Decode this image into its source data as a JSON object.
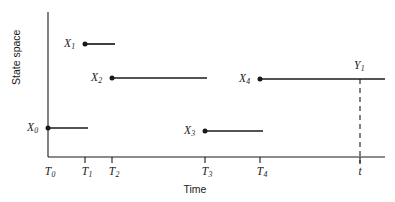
{
  "figure": {
    "type": "step-process-diagram",
    "background_color": "#ffffff",
    "line_color": "#1a1a1a",
    "width": 395,
    "height": 202
  },
  "axes": {
    "y": {
      "title": "State space",
      "x_px": 48,
      "top_px": 12,
      "bottom_px": 157
    },
    "x": {
      "title": "Time",
      "y_px": 157,
      "left_px": 48,
      "right_px": 385
    }
  },
  "ticks": [
    {
      "name": "T0",
      "base": "T",
      "sub": "0",
      "x_px": 48
    },
    {
      "name": "T1",
      "base": "T",
      "sub": "1",
      "x_px": 85
    },
    {
      "name": "T2",
      "base": "T",
      "sub": "2",
      "x_px": 112
    },
    {
      "name": "T3",
      "base": "T",
      "sub": "3",
      "x_px": 205
    },
    {
      "name": "T4",
      "base": "T",
      "sub": "4",
      "x_px": 260
    },
    {
      "name": "t",
      "base": "t",
      "sub": "",
      "x_px": 360
    }
  ],
  "segments": [
    {
      "name": "X0",
      "base": "X",
      "sub": "0",
      "x_start_px": 48,
      "x_end_px": 88,
      "y_px": 128,
      "label_x_px": 27,
      "label_y_px": 122,
      "dot": true
    },
    {
      "name": "X1",
      "base": "X",
      "sub": "1",
      "x_start_px": 85,
      "x_end_px": 115,
      "y_px": 44,
      "label_x_px": 64,
      "label_y_px": 38,
      "dot": true
    },
    {
      "name": "X2",
      "base": "X",
      "sub": "2",
      "x_start_px": 112,
      "x_end_px": 207,
      "y_px": 78,
      "label_x_px": 91,
      "label_y_px": 72,
      "dot": true
    },
    {
      "name": "X3",
      "base": "X",
      "sub": "3",
      "x_start_px": 205,
      "x_end_px": 263,
      "y_px": 131,
      "label_x_px": 184,
      "label_y_px": 125,
      "dot": true
    },
    {
      "name": "X4",
      "base": "X",
      "sub": "4",
      "x_start_px": 260,
      "x_end_px": 385,
      "y_px": 79,
      "label_x_px": 239,
      "label_y_px": 73,
      "dot": true
    }
  ],
  "marker": {
    "name": "Y1",
    "base": "Y",
    "sub": "1",
    "x_px": 360,
    "label_x_px": 354,
    "label_y_px": 60,
    "dashed_top_px": 79,
    "dashed_bottom_px": 164,
    "dash_pattern": "5,4"
  },
  "chart_data": {
    "type": "line",
    "title": "",
    "xlabel": "Time",
    "ylabel": "State space",
    "grid": false,
    "legend": null,
    "x_tick_labels": [
      "T0",
      "T1",
      "T2",
      "T3",
      "T4",
      "t"
    ],
    "y_tick_labels": [],
    "series": [
      {
        "name": "X0",
        "state_label": "X0",
        "t_start": "T0",
        "t_end": "T1",
        "level": 128
      },
      {
        "name": "X1",
        "state_label": "X1",
        "t_start": "T1",
        "t_end": "T2",
        "level": 44
      },
      {
        "name": "X2",
        "state_label": "X2",
        "t_start": "T2",
        "t_end": "T3",
        "level": 78
      },
      {
        "name": "X3",
        "state_label": "X3",
        "t_start": "T3",
        "t_end": "T4",
        "level": 131
      },
      {
        "name": "X4",
        "state_label": "X4",
        "t_start": "T4",
        "t_end": "t",
        "level": 79
      }
    ],
    "annotations": [
      {
        "text": "Y1",
        "at_time": "t",
        "meaning": "state observed at time t"
      }
    ]
  }
}
